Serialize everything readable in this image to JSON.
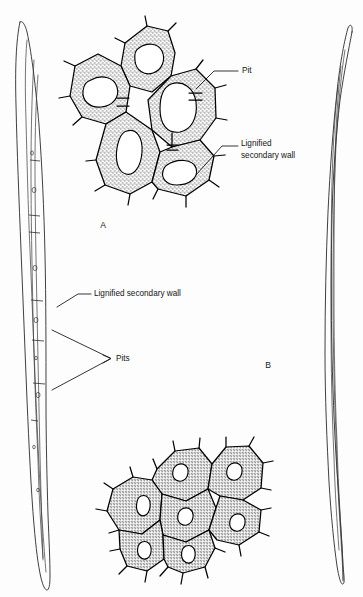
{
  "figure": {
    "background_color": "#fdfdfd",
    "ink_color": "#000000",
    "wall_fill_color": "#d8d8d8",
    "lumen_color": "#ffffff",
    "width": 363,
    "height": 597
  },
  "panel_labels": [
    {
      "id": "panel-a",
      "text": "A",
      "x": 103,
      "y": 226
    },
    {
      "id": "panel-b",
      "text": "B",
      "x": 268,
      "y": 366
    }
  ],
  "annotations": [
    {
      "id": "pit-upper",
      "text": "Pit",
      "lines": [
        "Pit"
      ],
      "text_x": 242,
      "text_y": 71,
      "leader": [
        [
          238,
          71
        ],
        [
          214,
          71
        ],
        [
          196,
          89
        ]
      ]
    },
    {
      "id": "lignified-secondary-wall-upper",
      "text": "Lignified secondary wall",
      "lines": [
        "Lignified",
        "secondary wall"
      ],
      "text_x": 241,
      "text_y": 144,
      "leader": [
        [
          238,
          146
        ],
        [
          222,
          146
        ],
        [
          196,
          175
        ]
      ]
    },
    {
      "id": "lignified-secondary-wall-fiber",
      "text": "Lignified secondary wall",
      "lines": [
        "Lignified secondary wall"
      ],
      "text_x": 94,
      "text_y": 296,
      "leader": [
        [
          91,
          294
        ],
        [
          78,
          294
        ],
        [
          57,
          307
        ]
      ]
    },
    {
      "id": "pits-fiber",
      "text": "Pits",
      "lines": [
        "Pits"
      ],
      "text_x": 114,
      "text_y": 359,
      "leader_branches": [
        [
          [
            110,
            358
          ],
          [
            52,
            330
          ]
        ],
        [
          [
            110,
            359
          ],
          [
            52,
            390
          ]
        ]
      ]
    }
  ],
  "cell_clusters": [
    {
      "id": "cluster-a",
      "panel": "A",
      "description": "Transverse section of fibres with thick lignified secondary walls and large lumens",
      "cell_count": 5,
      "lumen_size": "large"
    },
    {
      "id": "cluster-b",
      "panel": "B",
      "description": "Transverse section of fibres with very thick walls and small lumens",
      "cell_count": 7,
      "lumen_size": "small"
    }
  ],
  "fibers": [
    {
      "id": "fiber-left",
      "description": "Longitudinal view of a single elongated fibre showing pits and septa",
      "side": "left",
      "pit_count": 6,
      "septa_count": 4
    },
    {
      "id": "fiber-right",
      "description": "Longitudinal view of a single elongated fibre, tapering at both ends",
      "side": "right",
      "pit_count": 0,
      "septa_count": 0
    }
  ]
}
